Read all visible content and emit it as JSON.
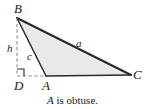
{
  "figure": {
    "name": "obtuse-triangle-altitude-diagram",
    "caption_variable": "A",
    "caption_text": "is obtuse.",
    "caption_full": "A is obtuse.",
    "colors": {
      "background": "#ffffff",
      "triangle_fill": "#e9e9e9",
      "stroke": "#2b2b2b",
      "dashed_stroke": "#8a8a8a",
      "label": "#1a1a1a"
    },
    "vertices": [
      {
        "id": "B",
        "label": "B",
        "x": 17,
        "y": 18,
        "label_x": 14,
        "label_y": 2
      },
      {
        "id": "A",
        "label": "A",
        "x": 46,
        "y": 76,
        "label_x": 42,
        "label_y": 79
      },
      {
        "id": "C",
        "label": "C",
        "x": 131,
        "y": 75,
        "label_x": 133,
        "label_y": 68
      },
      {
        "id": "D",
        "label": "D",
        "x": 17,
        "y": 76,
        "label_x": 14,
        "label_y": 79
      }
    ],
    "sides": [
      {
        "id": "a",
        "label": "a",
        "from": "B",
        "to": "C",
        "label_x": 76,
        "label_y": 38
      },
      {
        "id": "c",
        "label": "c",
        "from": "B",
        "to": "A",
        "label_x": 27,
        "label_y": 51
      },
      {
        "id": "h",
        "label": "h",
        "from": "B",
        "to": "D",
        "label_x": 7,
        "label_y": 43,
        "style": "dashed",
        "meaning": "altitude"
      }
    ],
    "markers": [
      {
        "id": "right-angle-at-D",
        "type": "right-angle-square",
        "x": 17,
        "y": 69,
        "size": 7
      }
    ],
    "dashed_segments": [
      {
        "id": "altitude-BD",
        "x1": 17,
        "y1": 18,
        "x2": 17,
        "y2": 76
      },
      {
        "id": "base-extension-DA",
        "x1": 17,
        "y1": 76,
        "x2": 46,
        "y2": 76
      }
    ]
  }
}
